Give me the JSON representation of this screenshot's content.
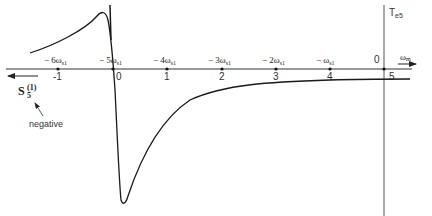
{
  "diagram": {
    "vertical_axis_label": "T",
    "vertical_axis_subscript": "e5",
    "horizontal_axis_label": "ω",
    "horizontal_axis_subscript": "m",
    "slip_axis_label": "S",
    "slip_axis_subscript": "5",
    "slip_axis_superscript": "(1)",
    "slip_direction_note": "negative",
    "slip_ticks": [
      "-1",
      "0",
      "1",
      "2",
      "3",
      "4",
      "5"
    ],
    "speed_ticks": [
      {
        "prefix": "− 6ω",
        "sub": "s1"
      },
      {
        "prefix": "− 5ω",
        "sub": "s1"
      },
      {
        "prefix": "− 4ω",
        "sub": "s1"
      },
      {
        "prefix": "− 3ω",
        "sub": "s1"
      },
      {
        "prefix": "− 2ω",
        "sub": "s1"
      },
      {
        "prefix": "− ω",
        "sub": "s1"
      },
      {
        "prefix": "0",
        "sub": ""
      }
    ],
    "colors": {
      "curve": "#1a1a1a",
      "axis": "#333333",
      "text": "#222222"
    }
  }
}
